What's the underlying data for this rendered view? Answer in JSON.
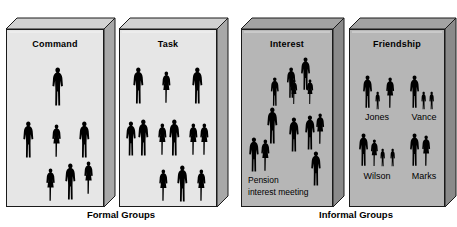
{
  "diagram": {
    "title_not_shown": "",
    "group_labels": [
      {
        "id": "formal",
        "text": "Formal Groups",
        "x": 61,
        "y": 209,
        "w": 120
      },
      {
        "id": "informal",
        "text": "Informal Groups",
        "x": 292,
        "y": 209,
        "w": 128
      }
    ],
    "panels": [
      {
        "id": "command",
        "title": "Command",
        "group": "formal",
        "x": 6,
        "y": 18,
        "w": 98,
        "h": 178,
        "depth": 11,
        "face_color": "#e6e6e6",
        "top_color": "#d2d2d2",
        "side_color": "#a8a8a8",
        "edge_color": "#1a1a1a",
        "title_y": 10,
        "figures": [
          {
            "type": "man",
            "x": 44,
            "y": 38,
            "h": 40
          },
          {
            "type": "man",
            "x": 15,
            "y": 92,
            "h": 38
          },
          {
            "type": "woman",
            "x": 44,
            "y": 95,
            "h": 34
          },
          {
            "type": "man",
            "x": 71,
            "y": 92,
            "h": 38
          },
          {
            "type": "woman",
            "x": 38,
            "y": 139,
            "h": 34
          },
          {
            "type": "man",
            "x": 57,
            "y": 134,
            "h": 38
          },
          {
            "type": "woman",
            "x": 76,
            "y": 132,
            "h": 34
          }
        ],
        "captions": [],
        "family_names": []
      },
      {
        "id": "task",
        "title": "Task",
        "group": "formal",
        "x": 119,
        "y": 18,
        "w": 98,
        "h": 178,
        "depth": 11,
        "face_color": "#e6e6e6",
        "top_color": "#d2d2d2",
        "side_color": "#a8a8a8",
        "edge_color": "#1a1a1a",
        "title_y": 10,
        "figures": [
          {
            "type": "man",
            "x": 12,
            "y": 38,
            "h": 38
          },
          {
            "type": "woman",
            "x": 41,
            "y": 42,
            "h": 33
          },
          {
            "type": "man",
            "x": 71,
            "y": 38,
            "h": 38
          },
          {
            "type": "man",
            "x": 5,
            "y": 92,
            "h": 36
          },
          {
            "type": "man",
            "x": 17,
            "y": 90,
            "h": 38
          },
          {
            "type": "woman",
            "x": 37,
            "y": 94,
            "h": 33
          },
          {
            "type": "man",
            "x": 48,
            "y": 90,
            "h": 38
          },
          {
            "type": "woman",
            "x": 68,
            "y": 94,
            "h": 33
          },
          {
            "type": "woman",
            "x": 79,
            "y": 94,
            "h": 33
          },
          {
            "type": "woman",
            "x": 38,
            "y": 140,
            "h": 33
          },
          {
            "type": "man",
            "x": 56,
            "y": 136,
            "h": 38
          },
          {
            "type": "woman",
            "x": 76,
            "y": 140,
            "h": 33
          }
        ],
        "captions": [],
        "family_names": []
      },
      {
        "id": "interest",
        "title": "Interest",
        "group": "informal",
        "x": 241,
        "y": 18,
        "w": 92,
        "h": 178,
        "depth": 11,
        "face_color": "#b6b6b6",
        "top_color": "#a3a3a3",
        "side_color": "#8a8a8a",
        "edge_color": "#1a1a1a",
        "title_y": 10,
        "figures": [
          {
            "type": "man",
            "x": 58,
            "y": 28,
            "h": 34
          },
          {
            "type": "man",
            "x": 44,
            "y": 38,
            "h": 32
          },
          {
            "type": "man",
            "x": 28,
            "y": 48,
            "h": 30
          },
          {
            "type": "woman",
            "x": 48,
            "y": 50,
            "h": 26
          },
          {
            "type": "woman",
            "x": 64,
            "y": 50,
            "h": 26
          },
          {
            "type": "man",
            "x": 24,
            "y": 78,
            "h": 38
          },
          {
            "type": "man",
            "x": 46,
            "y": 88,
            "h": 36
          },
          {
            "type": "man",
            "x": 62,
            "y": 86,
            "h": 36
          },
          {
            "type": "woman",
            "x": 73,
            "y": 84,
            "h": 32
          },
          {
            "type": "man",
            "x": 6,
            "y": 108,
            "h": 36
          },
          {
            "type": "woman",
            "x": 18,
            "y": 110,
            "h": 33
          },
          {
            "type": "man",
            "x": 68,
            "y": 122,
            "h": 36
          }
        ],
        "captions": [
          {
            "text": "Pension",
            "x": 7,
            "y": 146
          },
          {
            "text": "interest  meeting",
            "x": 7,
            "y": 158
          }
        ],
        "family_names": []
      },
      {
        "id": "friendship",
        "title": "Friendship",
        "group": "informal",
        "x": 349,
        "y": 18,
        "w": 96,
        "h": 178,
        "depth": 11,
        "face_color": "#b6b6b6",
        "top_color": "#a3a3a3",
        "side_color": "#8a8a8a",
        "edge_color": "#1a1a1a",
        "title_y": 10,
        "figures": [
          {
            "type": "man",
            "x": 12,
            "y": 46,
            "h": 34
          },
          {
            "type": "child",
            "x": 25,
            "y": 62,
            "h": 19
          },
          {
            "type": "woman",
            "x": 35,
            "y": 48,
            "h": 32
          },
          {
            "type": "man",
            "x": 59,
            "y": 46,
            "h": 34
          },
          {
            "type": "child",
            "x": 71,
            "y": 62,
            "h": 19
          },
          {
            "type": "child",
            "x": 79,
            "y": 62,
            "h": 19
          },
          {
            "type": "man",
            "x": 8,
            "y": 104,
            "h": 34
          },
          {
            "type": "woman",
            "x": 20,
            "y": 110,
            "h": 28
          },
          {
            "type": "child",
            "x": 30,
            "y": 119,
            "h": 19
          },
          {
            "type": "child",
            "x": 40,
            "y": 119,
            "h": 19
          },
          {
            "type": "man",
            "x": 59,
            "y": 104,
            "h": 34
          },
          {
            "type": "woman",
            "x": 71,
            "y": 106,
            "h": 32
          }
        ],
        "captions": [],
        "family_names": [
          {
            "text": "Jones",
            "x": 6,
            "y": 83,
            "w": 44
          },
          {
            "text": "Vance",
            "x": 53,
            "y": 83,
            "w": 44
          },
          {
            "text": "Wilson",
            "x": 4,
            "y": 142,
            "w": 48
          },
          {
            "text": "Marks",
            "x": 53,
            "y": 142,
            "w": 44
          }
        ]
      }
    ]
  }
}
